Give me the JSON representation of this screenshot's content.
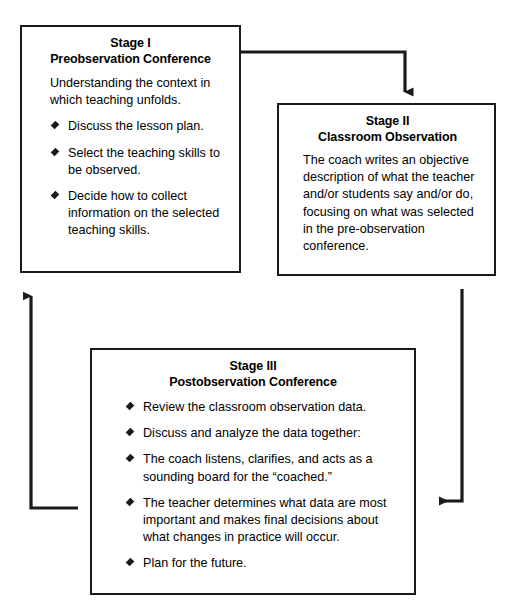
{
  "diagram": {
    "stroke_color": "#1a1a1a",
    "background_color": "#ffffff",
    "bullet_glyph": "diamond-bullet",
    "stages": [
      {
        "id": "stage-1",
        "label": "Stage I",
        "name": "Preobservation Conference",
        "intro": "Understanding the context in which teaching unfolds.",
        "bullets": [
          "Discuss the lesson plan.",
          "Select the teaching skills to be observed.",
          "Decide how to collect information on the selected teaching skills."
        ]
      },
      {
        "id": "stage-2",
        "label": "Stage II",
        "name": "Classroom Observation",
        "intro": "The coach writes an objective description of what the teacher and/or students say and/or do, focusing on what was selected in the pre-observation conference.",
        "bullets": []
      },
      {
        "id": "stage-3",
        "label": "Stage III",
        "name": "Postobservation Conference",
        "intro": "",
        "bullets": [
          "Review the classroom observation data.",
          "Discuss and analyze the data together:",
          "The coach listens, clarifies, and acts as a sounding board for the “coached.”",
          "The teacher determines what data are most important and makes final decisions about what changes in practice will occur.",
          "Plan for the future."
        ]
      }
    ],
    "connectors": [
      {
        "id": "connector-stage1-to-stage2",
        "from": "stage-1",
        "to": "stage-2",
        "direction": "right-then-down"
      },
      {
        "id": "connector-stage2-to-stage3",
        "from": "stage-2",
        "to": "stage-3",
        "direction": "down-then-left"
      },
      {
        "id": "connector-stage3-to-stage1",
        "from": "stage-3",
        "to": "stage-1",
        "direction": "left-then-up"
      }
    ]
  }
}
